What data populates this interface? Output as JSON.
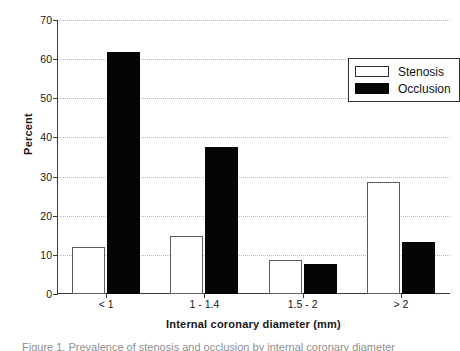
{
  "chart_data": {
    "type": "bar",
    "title": "",
    "subtitle": "",
    "xlabel": "Internal coronary diameter (mm)",
    "ylabel": "Percent",
    "categories": [
      "< 1",
      "1 - 1.4",
      "1.5 - 2",
      "> 2"
    ],
    "series": [
      {
        "name": "Stenosis",
        "values": [
          12.0,
          14.8,
          8.7,
          28.5
        ],
        "color": "#ffffff",
        "edge_color": "#5e5e5e"
      },
      {
        "name": "Occlusion",
        "values": [
          61.8,
          37.5,
          7.6,
          13.4
        ],
        "color": "#050505",
        "edge_color": "#050505"
      }
    ],
    "ylim": [
      0,
      70
    ],
    "ytick_values": [
      0,
      10,
      20,
      30,
      40,
      50,
      60,
      70
    ],
    "ytick_labels": [
      "0",
      "10",
      "20",
      "30",
      "40",
      "50",
      "60",
      "70"
    ],
    "grid": true,
    "grid_style": "dotted",
    "grid_axis": "y",
    "legend_position": "top-right",
    "legend_entries": [
      "Stenosis",
      "Occlusion"
    ]
  },
  "caption": {
    "text": "Figure 1. Prevalence of stenosis and occlusion by internal coronary diameter"
  }
}
